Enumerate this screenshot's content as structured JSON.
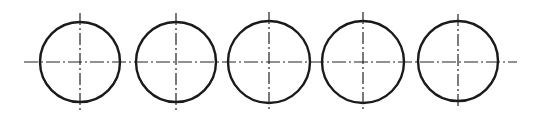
{
  "diagram": {
    "stroke_color": "#1a1a1a",
    "centerline_color": "#222222",
    "horizontal_centerline": {
      "x1": 24,
      "x2": 517,
      "y": 62
    },
    "circles": [
      {
        "id": 1,
        "cx": 80,
        "cy": 62,
        "r": 40,
        "vline": {
          "y1": 13,
          "y2": 110
        }
      },
      {
        "id": 2,
        "cx": 176,
        "cy": 62,
        "r": 40,
        "vline": {
          "y1": 13,
          "y2": 110
        }
      },
      {
        "id": 3,
        "cx": 269,
        "cy": 62,
        "r": 41,
        "vline": {
          "y1": 12,
          "y2": 110
        }
      },
      {
        "id": 4,
        "cx": 363,
        "cy": 62,
        "r": 41,
        "vline": {
          "y1": 12,
          "y2": 110
        }
      },
      {
        "id": 5,
        "cx": 458,
        "cy": 61,
        "r": 40,
        "vline": {
          "y1": 14,
          "y2": 109
        }
      }
    ]
  }
}
